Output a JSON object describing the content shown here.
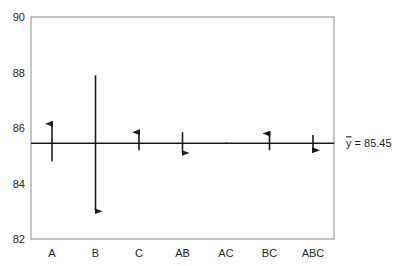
{
  "chart_data": {
    "type": "effects-arrow-plot",
    "title": "",
    "xlabel": "",
    "ylabel": "",
    "ylim": [
      82,
      90
    ],
    "yticks": [
      82,
      84,
      86,
      88,
      90
    ],
    "grid": false,
    "categories": [
      "A",
      "B",
      "C",
      "AB",
      "AC",
      "BC",
      "ABC"
    ],
    "series": [
      {
        "name": "low level (arrow tail)",
        "values": [
          84.8,
          87.9,
          85.2,
          85.85,
          85.42,
          85.2,
          85.75
        ]
      },
      {
        "name": "high level (arrow head)",
        "values": [
          86.15,
          83.0,
          85.85,
          85.1,
          85.48,
          85.8,
          85.2
        ]
      }
    ],
    "direction": [
      "up",
      "down",
      "up",
      "down",
      "flat",
      "up",
      "down"
    ],
    "mean": 85.45,
    "mean_label": "ȳ = 85.45",
    "mean_label_position": "right, outside plot"
  },
  "axis": {
    "y_tick_labels": [
      "90",
      "88",
      "86",
      "84",
      "82"
    ],
    "x_tick_labels": [
      "A",
      "B",
      "C",
      "AB",
      "AC",
      "BC",
      "ABC"
    ]
  },
  "annotation": {
    "mean_symbol": "y",
    "mean_text": " = 85.45"
  },
  "style": {
    "line_color": "#1a1a1a",
    "frame_color": "#8a8a8a",
    "background": "#ffffff"
  }
}
